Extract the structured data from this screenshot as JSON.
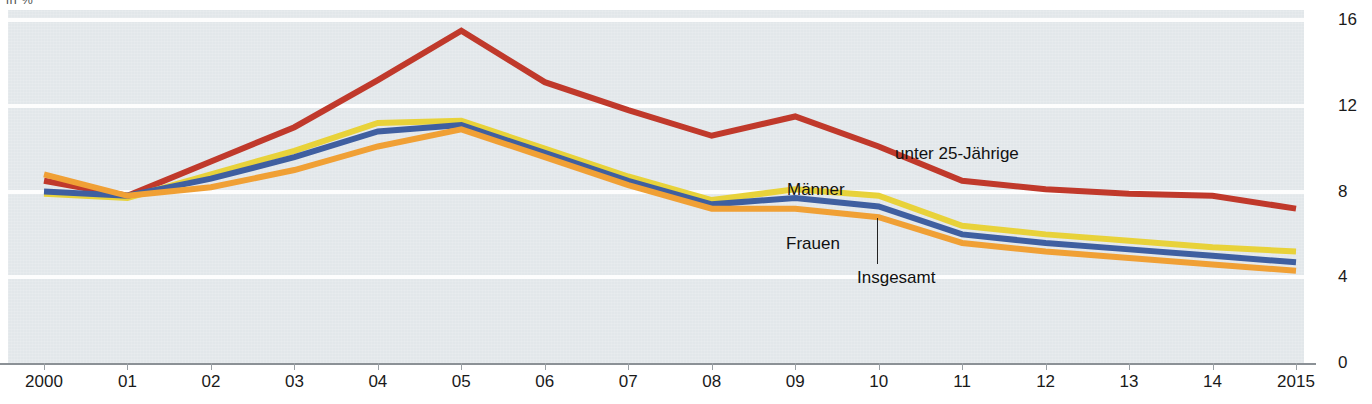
{
  "top_fragment": "in %",
  "chart_data": {
    "type": "line",
    "title": "",
    "subtitle": "",
    "xlabel": "",
    "ylabel": "in %",
    "grid": true,
    "legend_position": "inline-annotations",
    "x": [
      "2000",
      "01",
      "02",
      "03",
      "04",
      "05",
      "06",
      "07",
      "08",
      "09",
      "10",
      "11",
      "12",
      "13",
      "14",
      "2015"
    ],
    "categories": [
      "2000",
      "01",
      "02",
      "03",
      "04",
      "05",
      "06",
      "07",
      "08",
      "09",
      "10",
      "11",
      "12",
      "13",
      "14",
      "2015"
    ],
    "xlim": [
      2000,
      2015
    ],
    "ylim": [
      0,
      16
    ],
    "yticks": [
      "0",
      "4",
      "8",
      "12",
      "16"
    ],
    "ytick_values": [
      0,
      4,
      8,
      12,
      16
    ],
    "series": [
      {
        "name": "unter 25-Jährige",
        "color": "#c0392b",
        "values": [
          8.5,
          7.8,
          9.4,
          11.0,
          13.2,
          15.5,
          13.1,
          11.8,
          10.6,
          11.5,
          10.1,
          8.5,
          8.1,
          7.9,
          7.8,
          7.2
        ]
      },
      {
        "name": "Männer",
        "color": "#e8d23a",
        "values": [
          7.9,
          7.7,
          8.8,
          9.9,
          11.2,
          11.3,
          10.0,
          8.7,
          7.6,
          8.1,
          7.8,
          6.4,
          6.0,
          5.7,
          5.4,
          5.2
        ]
      },
      {
        "name": "Insgesamt",
        "color": "#3f5fa0",
        "values": [
          8.0,
          7.8,
          8.6,
          9.6,
          10.8,
          11.1,
          9.8,
          8.5,
          7.4,
          7.7,
          7.3,
          6.0,
          5.6,
          5.3,
          5.0,
          4.7
        ]
      },
      {
        "name": "Frauen",
        "color": "#f0a035",
        "values": [
          8.8,
          7.8,
          8.2,
          9.0,
          10.1,
          10.9,
          9.6,
          8.3,
          7.2,
          7.2,
          6.8,
          5.6,
          5.2,
          4.9,
          4.6,
          4.3
        ]
      }
    ],
    "annotations": [
      {
        "text": "unter 25-Jährige",
        "series": "unter 25-Jährige",
        "x_px": 895,
        "y_px": 144
      },
      {
        "text": "Männer",
        "series": "Männer",
        "x_px": 787,
        "y_px": 180
      },
      {
        "text": "Frauen",
        "series": "Frauen",
        "x_px": 786,
        "y_px": 234
      },
      {
        "text": "Insgesamt",
        "series": "Insgesamt",
        "x_px": 857,
        "y_px": 268
      }
    ]
  },
  "colors": {
    "plot_background": "#e2e7ea",
    "gridline": "#fdfdfd",
    "axis": "#8b9196",
    "page_background": "#ffffff",
    "unter25": "#c0392b",
    "maenner": "#e8d23a",
    "insgesamt": "#3f5fa0",
    "frauen": "#f0a035"
  }
}
